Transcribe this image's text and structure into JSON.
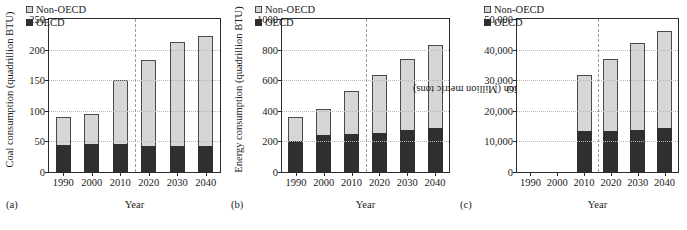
{
  "figure": {
    "xlabel": "Year",
    "legend": {
      "non_oecd": "Non-OECD",
      "oecd": "OECD"
    },
    "colors": {
      "non_oecd": "#d6d6d6",
      "oecd": "#2f2f2f",
      "axis": "#2b2b2b",
      "grid": "#b9b9b9"
    }
  },
  "chart_data": [
    {
      "type": "bar",
      "panel_label": "(a)",
      "title": "",
      "ylabel": "Coal consumption (quadrillion BTU)",
      "xlabel": "Year",
      "categories": [
        "1990",
        "2000",
        "2010",
        "2020",
        "2030",
        "2040"
      ],
      "ylim": [
        0,
        250
      ],
      "yticks": [
        0,
        50,
        100,
        150,
        200,
        250
      ],
      "ytick_labels": [
        "0",
        "50",
        "100",
        "150",
        "200",
        "250"
      ],
      "stacked": true,
      "grid": true,
      "legend_position": "upper left",
      "projection_divider_after": "2010",
      "series": [
        {
          "name": "OECD",
          "values": [
            44,
            45,
            45,
            42,
            42,
            42
          ]
        },
        {
          "name": "Non-OECD",
          "values": [
            45,
            48,
            103,
            138,
            167,
            177
          ]
        }
      ],
      "totals": [
        89,
        93,
        148,
        180,
        209,
        219
      ]
    },
    {
      "type": "bar",
      "panel_label": "(b)",
      "title": "",
      "ylabel": "Energy consumption (quadrillion BTU)",
      "xlabel": "Year",
      "categories": [
        "1990",
        "2000",
        "2010",
        "2020",
        "2030",
        "2040"
      ],
      "ylim": [
        0,
        1000
      ],
      "yticks": [
        0,
        200,
        400,
        600,
        800,
        1000
      ],
      "ytick_labels": [
        "0",
        "200",
        "400",
        "600",
        "800",
        "1000"
      ],
      "stacked": true,
      "grid": true,
      "legend_position": "upper left",
      "projection_divider_after": "2010",
      "series": [
        {
          "name": "OECD",
          "values": [
            200,
            238,
            245,
            254,
            268,
            284
          ]
        },
        {
          "name": "Non-OECD",
          "values": [
            155,
            168,
            278,
            375,
            458,
            533
          ]
        }
      ],
      "totals": [
        355,
        406,
        523,
        629,
        726,
        817
      ]
    },
    {
      "type": "bar",
      "panel_label": "(c)",
      "title": "",
      "ylabel": "CO2 emission (Million metric tons)",
      "ylabel_prefix": "CO",
      "ylabel_sub": "2",
      "ylabel_suffix": " emission (Million metric tons)",
      "xlabel": "Year",
      "categories": [
        "1990",
        "2000",
        "2010",
        "2020",
        "2030",
        "2040"
      ],
      "ylim": [
        0,
        50000
      ],
      "yticks": [
        0,
        10000,
        20000,
        30000,
        40000,
        50000
      ],
      "ytick_labels": [
        "0",
        "10,000",
        "20,000",
        "30,000",
        "40,000",
        "50,000"
      ],
      "stacked": true,
      "grid": true,
      "legend_position": "upper left",
      "projection_divider_after": "2010",
      "series": [
        {
          "name": "OECD",
          "values": [
            null,
            null,
            13100,
            13200,
            13700,
            14100
          ]
        },
        {
          "name": "Non-OECD",
          "values": [
            null,
            null,
            18200,
            23300,
            27800,
            31300
          ]
        }
      ],
      "totals": [
        null,
        null,
        31300,
        36500,
        41500,
        45400
      ]
    }
  ]
}
